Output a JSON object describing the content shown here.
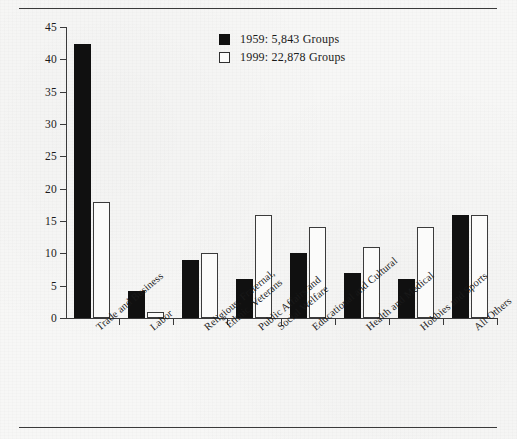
{
  "chart_data": {
    "type": "bar",
    "title": "",
    "xlabel": "",
    "ylabel": "Percentage of Groups Listed",
    "ylim": [
      0,
      45
    ],
    "yticks": [
      0,
      5,
      10,
      15,
      20,
      25,
      30,
      35,
      40,
      45
    ],
    "grid": false,
    "legend_position": "top-center-right",
    "categories": [
      "Trade and Business",
      "Labor",
      "Religious, Fraternal,\nEthnic, Veterans",
      "Public Affairs and\nSocial Welfare",
      "Educational and Cultural",
      "Health and Medical",
      "Hobbies and Sports",
      "All Others"
    ],
    "category_lines": [
      [
        "Trade and Business"
      ],
      [
        "Labor"
      ],
      [
        "Religious, Fraternal,",
        "Ethnic, Veterans"
      ],
      [
        "Public Affairs and",
        "Social Welfare"
      ],
      [
        "Educational and Cultural"
      ],
      [
        "Health and Medical"
      ],
      [
        "Hobbies and Sports"
      ],
      [
        "All Others"
      ]
    ],
    "series": [
      {
        "name": "1959: 5,843 Groups",
        "year": "1959",
        "color": "#101010",
        "style": "filled",
        "values": [
          42.3,
          4.2,
          9,
          6,
          10,
          7,
          6,
          16
        ]
      },
      {
        "name": "1999: 22,878 Groups",
        "year": "1999",
        "color": "#ffffff",
        "style": "outlined",
        "values": [
          18,
          1,
          10,
          16,
          14,
          11,
          14,
          16
        ]
      }
    ]
  },
  "legend": {
    "items": [
      {
        "label": "1959: 5,843 Groups",
        "swatch": "dark"
      },
      {
        "label": "1999: 22,878 Groups",
        "swatch": "light"
      }
    ]
  },
  "rules": {
    "top": "horizontal-rule",
    "bottom": "horizontal-rule"
  }
}
